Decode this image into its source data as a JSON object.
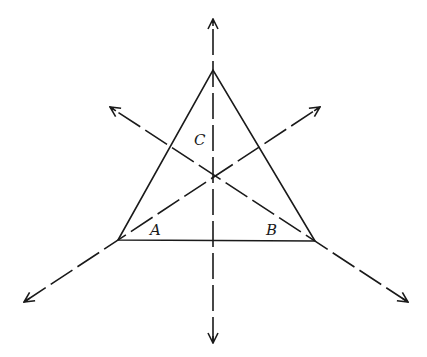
{
  "diagram": {
    "stroke_color": "#1a1a1a",
    "background": "#ffffff",
    "triangle": {
      "vertices": {
        "A": [
          118,
          240
        ],
        "B": [
          315,
          241
        ],
        "C": [
          213,
          70
        ]
      }
    },
    "incenter": [
      214,
      176
    ],
    "bisector_lines": [
      {
        "name": "bisector-C",
        "from": [
          213,
          343
        ],
        "to": [
          213,
          19
        ],
        "arrow_start": true,
        "arrow_end": true
      },
      {
        "name": "bisector-A",
        "from": [
          24,
          302
        ],
        "to": [
          320,
          107
        ],
        "arrow_start": true,
        "arrow_end": true
      },
      {
        "name": "bisector-B",
        "from": [
          408,
          302
        ],
        "to": [
          110,
          107
        ],
        "arrow_start": true,
        "arrow_end": true
      }
    ],
    "labels": [
      {
        "text": "C",
        "x": 194,
        "y": 133
      },
      {
        "text": "A",
        "x": 150,
        "y": 223
      },
      {
        "text": "B",
        "x": 266,
        "y": 223
      }
    ]
  }
}
